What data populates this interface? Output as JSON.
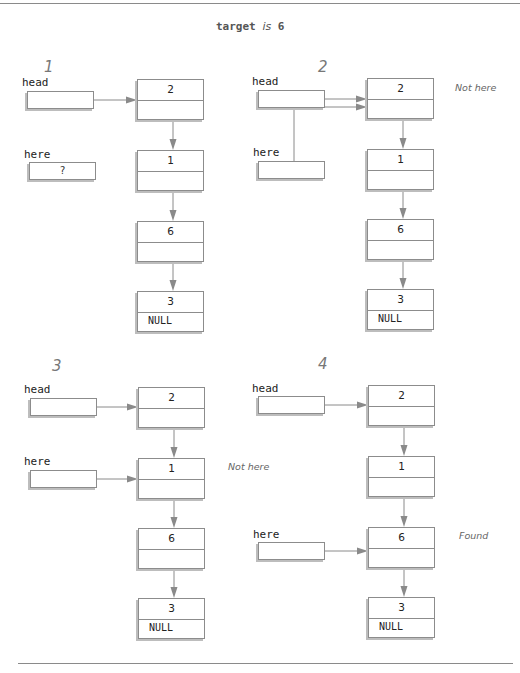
{
  "title": {
    "prefix": "target",
    "is": "is",
    "value": "6"
  },
  "colors": {
    "line": "#8c8c8c",
    "arrow": "#8a8a8a",
    "shadow": "#bdbdbd",
    "text": "#222222",
    "note": "#666666"
  },
  "panels": [
    {
      "step": "1",
      "step_pos": [
        44,
        58
      ],
      "head": {
        "label": "head",
        "label_pos": [
          22,
          76
        ],
        "box": [
          27,
          91
        ],
        "value": ""
      },
      "here": {
        "label": "here",
        "label_pos": [
          24,
          148
        ],
        "box": [
          29,
          162
        ],
        "value": "?"
      },
      "nodes": [
        {
          "data": "2",
          "next": "",
          "pos": [
            137,
            79
          ]
        },
        {
          "data": "1",
          "next": "",
          "pos": [
            137,
            150
          ]
        },
        {
          "data": "6",
          "next": "",
          "pos": [
            137,
            221
          ]
        },
        {
          "data": "3",
          "next": "NULL",
          "pos": [
            137,
            291
          ]
        }
      ],
      "note": null
    },
    {
      "step": "2",
      "step_pos": [
        318,
        58
      ],
      "head": {
        "label": "head",
        "label_pos": [
          252,
          75
        ],
        "box": [
          258,
          90
        ],
        "value": ""
      },
      "here": {
        "label": "here",
        "label_pos": [
          253,
          146
        ],
        "box": [
          258,
          161
        ],
        "value": ""
      },
      "nodes": [
        {
          "data": "2",
          "next": "",
          "pos": [
            367,
            78
          ]
        },
        {
          "data": "1",
          "next": "",
          "pos": [
            367,
            149
          ]
        },
        {
          "data": "6",
          "next": "",
          "pos": [
            367,
            219
          ]
        },
        {
          "data": "3",
          "next": "NULL",
          "pos": [
            367,
            289
          ]
        }
      ],
      "note": {
        "text": "Not here",
        "pos": [
          455,
          82
        ]
      }
    },
    {
      "step": "3",
      "step_pos": [
        52,
        357
      ],
      "head": {
        "label": "head",
        "label_pos": [
          24,
          383
        ],
        "box": [
          30,
          398
        ],
        "value": ""
      },
      "here": {
        "label": "here",
        "label_pos": [
          24,
          455
        ],
        "box": [
          30,
          470
        ],
        "value": ""
      },
      "nodes": [
        {
          "data": "2",
          "next": "",
          "pos": [
            138,
            387
          ]
        },
        {
          "data": "1",
          "next": "",
          "pos": [
            138,
            458
          ]
        },
        {
          "data": "6",
          "next": "",
          "pos": [
            138,
            528
          ]
        },
        {
          "data": "3",
          "next": "NULL",
          "pos": [
            138,
            598
          ]
        }
      ],
      "note": {
        "text": "Not here",
        "pos": [
          228,
          461
        ]
      }
    },
    {
      "step": "4",
      "step_pos": [
        318,
        355
      ],
      "head": {
        "label": "head",
        "label_pos": [
          252,
          382
        ],
        "box": [
          258,
          396
        ],
        "value": ""
      },
      "here": {
        "label": "here",
        "label_pos": [
          253,
          528
        ],
        "box": [
          258,
          542
        ],
        "value": ""
      },
      "nodes": [
        {
          "data": "2",
          "next": "",
          "pos": [
            368,
            385
          ]
        },
        {
          "data": "1",
          "next": "",
          "pos": [
            368,
            456
          ]
        },
        {
          "data": "6",
          "next": "",
          "pos": [
            368,
            527
          ]
        },
        {
          "data": "3",
          "next": "NULL",
          "pos": [
            368,
            597
          ]
        }
      ],
      "note": {
        "text": "Found",
        "pos": [
          459,
          530
        ]
      }
    }
  ],
  "here_targets": [
    null,
    0,
    1,
    2
  ],
  "rules": {
    "top": {
      "y": 3,
      "x1": 0,
      "x2": 520
    },
    "bottom": {
      "y": 663,
      "x1": 18,
      "x2": 513
    }
  }
}
